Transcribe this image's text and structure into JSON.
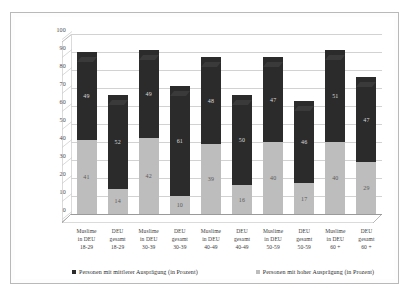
{
  "chart_data": {
    "type": "bar",
    "subtype": "stacked-column",
    "title": "",
    "xlabel": "",
    "ylabel": "",
    "ylim": [
      0,
      100
    ],
    "yticks": [
      0,
      10,
      20,
      30,
      40,
      50,
      60,
      70,
      80,
      90,
      100
    ],
    "ytick_labels": [
      "0",
      "10",
      "20",
      "30",
      "40",
      "50",
      "60",
      "70",
      "80",
      "90",
      "100"
    ],
    "grid": true,
    "legend_position": "bottom",
    "categories": [
      "Muslime in DEU 18-29",
      "DEU gesamt 18-29",
      "Muslime in DEU 30-39",
      "DEU gesamt 30-39",
      "Muslime in DEU 40-49",
      "DEU gesamt 40-49",
      "Muslime in DEU 50-59",
      "DEU gesamt 50-59",
      "Muslime in DEU 60+",
      "DEU gesamt 60+"
    ],
    "category_lines": [
      [
        "Muslime",
        "in DEU",
        "18-29"
      ],
      [
        "DEU",
        "gesamt",
        "18-29"
      ],
      [
        "Muslime",
        "in DEU",
        "30-39"
      ],
      [
        "DEU",
        "gesamt",
        "30-39"
      ],
      [
        "Muslime",
        "in DEU",
        "40-49"
      ],
      [
        "DEU",
        "gesamt",
        "40-49"
      ],
      [
        "Muslime",
        "in DEU",
        "50-59"
      ],
      [
        "DEU",
        "gesamt",
        "50-59"
      ],
      [
        "Muslime",
        "in DEU",
        "60 +"
      ],
      [
        "DEU",
        "gesamt",
        "60 +"
      ]
    ],
    "series": [
      {
        "name": "Personen mit hoher Ausprägung (in Prozent)",
        "key": "low",
        "color": "#bdbdbd",
        "values": [
          41,
          14,
          42,
          10,
          39,
          16,
          40,
          17,
          40,
          29
        ]
      },
      {
        "name": "Personen mit mittlerer Ausprägung (in Prozent)",
        "key": "mid",
        "color": "#2b2b2b",
        "values": [
          49,
          52,
          49,
          61,
          48,
          50,
          47,
          46,
          51,
          47
        ]
      }
    ],
    "totals": [
      90,
      66,
      91,
      71,
      87,
      66,
      87,
      63,
      91,
      76
    ]
  },
  "legend": {
    "items": [
      {
        "label": "Personen mit mittlerer Ausprägung (in Prozent)",
        "swatch": "mid"
      },
      {
        "label": "Personen mit hoher Ausprägung (in Prozent)",
        "swatch": "low"
      }
    ]
  },
  "colors": {
    "mid_series": "#2b2b2b",
    "low_series": "#bdbdbd",
    "gridline": "#d2d2d2",
    "axis": "#9a9a9a",
    "frame": "#b9b9b9",
    "background": "#ffffff"
  }
}
